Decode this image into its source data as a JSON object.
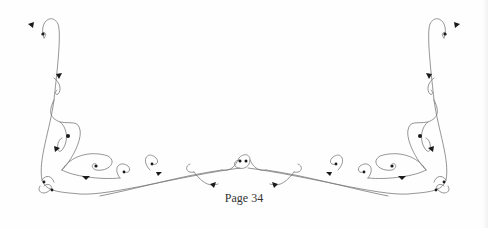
{
  "page": {
    "page_number_label": "Page 34",
    "ornament": {
      "name": "scrollwork-border",
      "line_color": "#777777",
      "leaf_color": "#1a1a1a"
    }
  }
}
